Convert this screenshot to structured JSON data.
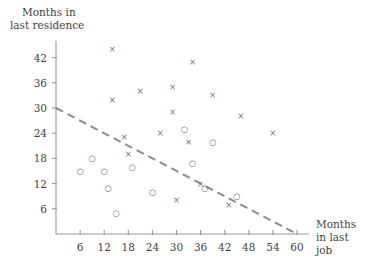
{
  "chart_data": {
    "type": "scatter",
    "title": "",
    "xlabel": "Months in last job",
    "ylabel": "Months in last residence",
    "xlim": [
      0,
      63
    ],
    "ylim": [
      0,
      46
    ],
    "xticks": [
      6,
      12,
      18,
      24,
      30,
      36,
      42,
      48,
      54,
      60
    ],
    "yticks": [
      6,
      12,
      18,
      24,
      30,
      36,
      42
    ],
    "grid": false,
    "legend_position": "none",
    "series": [
      {
        "name": "x-markers",
        "marker": "x",
        "points": [
          [
            14,
            44
          ],
          [
            14,
            32
          ],
          [
            17,
            23
          ],
          [
            18,
            19
          ],
          [
            21,
            34
          ],
          [
            26,
            24
          ],
          [
            29,
            35
          ],
          [
            29,
            29
          ],
          [
            30,
            8
          ],
          [
            33,
            22
          ],
          [
            34,
            41
          ],
          [
            36,
            12
          ],
          [
            39,
            33
          ],
          [
            43,
            7
          ],
          [
            46,
            28
          ],
          [
            54,
            24
          ]
        ]
      },
      {
        "name": "o-markers",
        "marker": "o",
        "points": [
          [
            6,
            15
          ],
          [
            9,
            18
          ],
          [
            12,
            15
          ],
          [
            13,
            11
          ],
          [
            15,
            5
          ],
          [
            19,
            16
          ],
          [
            24,
            10
          ],
          [
            32,
            25
          ],
          [
            34,
            17
          ],
          [
            37,
            11
          ],
          [
            39,
            22
          ],
          [
            45,
            9
          ]
        ]
      }
    ],
    "trendline": {
      "label": "",
      "style": "dashed",
      "x_start": 0,
      "y_start": 30,
      "x_end": 60,
      "y_end": 0
    }
  },
  "colors": {
    "axis": "#9a9a9a",
    "marker": "#6e6e6e",
    "trend": "#8c8c8c",
    "text": "#3f3f3f",
    "background": "#ffffff"
  }
}
